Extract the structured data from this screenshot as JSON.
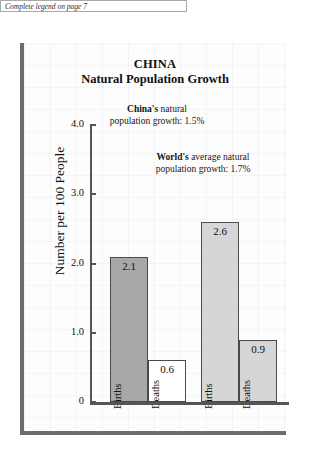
{
  "caption": {
    "text": "Complete legend on page 7"
  },
  "chart_data": {
    "type": "bar",
    "title": "CHINA",
    "subtitle": "Natural Population Growth",
    "xlabel": "",
    "ylabel": "Number per 100 People",
    "ylim": [
      0,
      4.0
    ],
    "ytick_labels": [
      "4.0",
      "3.0",
      "2.0",
      "1.0",
      "0"
    ],
    "ytick_values": [
      4.0,
      3.0,
      2.0,
      1.0,
      0
    ],
    "grid": false,
    "legend": "none",
    "categories": [
      "Births",
      "Deaths"
    ],
    "groups": [
      {
        "name": "China",
        "bars": [
          {
            "label": "Births",
            "value": 2.1,
            "value_text": "2.1",
            "color": "#a8a8a8"
          },
          {
            "label": "Deaths",
            "value": 0.6,
            "value_text": "0.6",
            "color": "#ffffff"
          }
        ]
      },
      {
        "name": "World",
        "bars": [
          {
            "label": "Births",
            "value": 2.6,
            "value_text": "2.6",
            "color": "#d6d6d6"
          },
          {
            "label": "Deaths",
            "value": 0.9,
            "value_text": "0.9",
            "color": "#d6d6d6"
          }
        ]
      }
    ],
    "annotations": [
      {
        "emphasis": "China's",
        "line1_rest": " natural",
        "line2": "population growth:  1.5%",
        "value": 1.5
      },
      {
        "emphasis": "World's",
        "line1_rest": " average natural",
        "line2": "population growth:  1.7%",
        "value": 1.7
      }
    ]
  },
  "colors": {
    "panel_border": "#6d6d6d",
    "axis": "#555555",
    "bar_outline": "#4a4a4a",
    "text": "#111111"
  }
}
